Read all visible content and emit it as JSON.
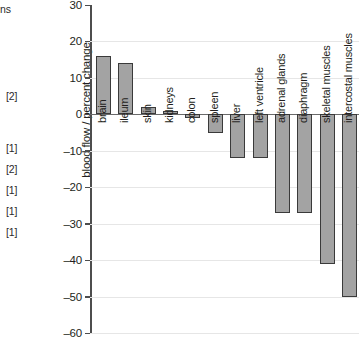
{
  "margin": {
    "notes": [
      {
        "text": "ns",
        "top": 3
      },
      {
        "text": "[2]",
        "top": 90
      },
      {
        "text": "[1]",
        "top": 142
      },
      {
        "text": "[2]",
        "top": 163
      },
      {
        "text": "[1]",
        "top": 184
      },
      {
        "text": "[1]",
        "top": 205
      },
      {
        "text": "[1]",
        "top": 226
      }
    ]
  },
  "chart_data": {
    "type": "bar",
    "title": "",
    "xlabel": "",
    "ylabel": "blood flow / percent change",
    "ylim": [
      -60,
      30
    ],
    "ytick_step": 10,
    "yticks": [
      30,
      20,
      10,
      0,
      -10,
      -20,
      -30,
      -40,
      -50,
      -60
    ],
    "ytick_labels": [
      "30",
      "20",
      "10",
      "0",
      "–10",
      "–20",
      "–30",
      "–40",
      "–50",
      "–60"
    ],
    "grid": true,
    "legend": null,
    "bar_color": "#a3a3a3",
    "bar_edge_color": "#3a3a3a",
    "categories": [
      "brain",
      "ileum",
      "skin",
      "kidneys",
      "colon",
      "spleen",
      "liver",
      "left ventricle",
      "adrenal glands",
      "diaphragm",
      "skeletal muscles",
      "intercostal muscles"
    ],
    "values": [
      16,
      14,
      2,
      1,
      -1,
      -5,
      -12,
      -12,
      -27,
      -27,
      -41,
      -50
    ]
  }
}
